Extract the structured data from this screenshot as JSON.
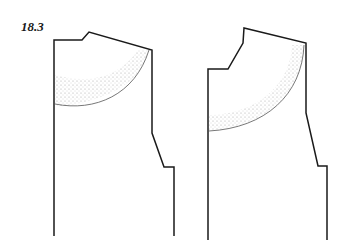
{
  "figure": {
    "label": "18.3",
    "panels": [
      {
        "name": "pattern-piece-left",
        "description": "Pattern piece with shaded curved region near upper area"
      },
      {
        "name": "pattern-piece-right",
        "description": "Pattern piece with raised stepped top and shaded curved region"
      }
    ],
    "colors": {
      "outline": "#1a1a1a",
      "shading": "#b0b0b0",
      "background": "#ffffff"
    }
  }
}
